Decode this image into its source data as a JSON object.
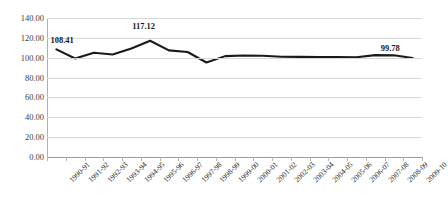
{
  "chart_data": {
    "type": "line",
    "title": "",
    "subtitle": "",
    "xlabel": "",
    "ylabel": "",
    "grid": "horizontal",
    "legend": "none",
    "ylim": [
      0,
      140
    ],
    "ytick_step": 20,
    "ytick_labels": [
      "140.00",
      "120.00",
      "100.00",
      "80.00",
      "60.00",
      "40.00",
      "20.00",
      "0.00"
    ],
    "ytick_values": [
      140,
      120,
      100,
      80,
      60,
      40,
      20,
      0
    ],
    "categories": [
      "1990-91",
      "1991-92",
      "1992-93",
      "1993-94",
      "1994-95",
      "1995-96",
      "1996-97",
      "1997-98",
      "1998-99",
      "1999-00",
      "2000-01",
      "2001-02",
      "2002-03",
      "2003-04",
      "2004-05",
      "2005-06",
      "2006-07",
      "2007-08",
      "2008-09",
      "2009-10"
    ],
    "series": [
      {
        "name": "Index",
        "color": "#1a1a1a",
        "values": [
          108.41,
          99.2,
          105.0,
          103.3,
          109.2,
          117.12,
          107.4,
          105.8,
          95.2,
          101.6,
          102.2,
          102.0,
          100.9,
          100.8,
          100.7,
          100.6,
          100.4,
          102.6,
          102.4,
          99.78
        ]
      }
    ],
    "data_labels": [
      {
        "category": "1990-91",
        "value": "108.41",
        "index": 0
      },
      {
        "category": "1995-96",
        "value": "117.12",
        "index": 5
      },
      {
        "category": "2009-10",
        "value": "99.78",
        "index": 19
      }
    ],
    "colors": {
      "line": "#1a1a1a",
      "gridline": "#d8d8d8",
      "axis": "#9a9a9a",
      "tick_text": "#404040",
      "label_text": "#1a1a1a",
      "background": "#ffffff"
    }
  }
}
